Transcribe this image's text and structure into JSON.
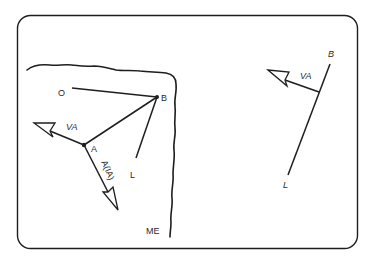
{
  "diagram": {
    "colors": {
      "ink": "#1e1e1e",
      "background": "#ffffff"
    },
    "left_panel": {
      "labels": {
        "O": "O",
        "B": "B",
        "A": "A",
        "L": "L",
        "VA": "VA",
        "AIA": "A(IA)",
        "ME": "ME"
      }
    },
    "right_panel": {
      "labels": {
        "B": "B",
        "VA": "VA",
        "L": "L"
      }
    }
  }
}
